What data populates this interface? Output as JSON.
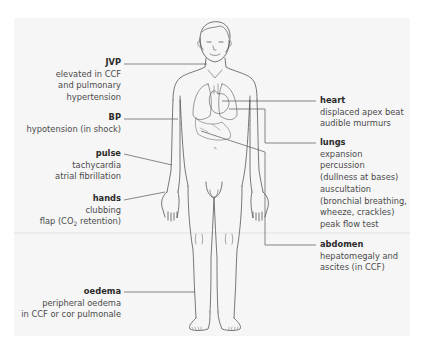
{
  "diagram": {
    "labels": {
      "jvp": {
        "title": "JVP",
        "lines": [
          "elevated in CCF",
          "and pulmonary",
          "hypertension"
        ]
      },
      "bp": {
        "title": "BP",
        "lines": [
          "hypotension (in shock)"
        ]
      },
      "pulse": {
        "title": "pulse",
        "lines": [
          "tachycardia",
          "atrial fibrillation"
        ]
      },
      "hands": {
        "title": "hands",
        "lines": [
          "clubbing"
        ],
        "line2_prefix": "flap (CO",
        "line2_sub": "2",
        "line2_suffix": " retention)"
      },
      "oedema": {
        "title": "oedema",
        "lines": [
          "peripheral oedema",
          "in CCF or cor pulmonale"
        ]
      },
      "heart": {
        "title": "heart",
        "lines": [
          "displaced apex beat",
          "audible murmurs"
        ]
      },
      "lungs": {
        "title": "lungs",
        "lines": [
          "expansion",
          "percussion",
          "(dullness at bases)",
          "auscultation",
          "(bronchial breathing,",
          "wheeze, crackles)",
          "peak flow test"
        ]
      },
      "abdomen": {
        "title": "abdomen",
        "lines": [
          "hepatomegaly and",
          "ascites (in CCF)"
        ]
      }
    },
    "colors": {
      "panel": "#f6f6f6",
      "line": "#555555",
      "text": "#3a3a3a"
    }
  }
}
